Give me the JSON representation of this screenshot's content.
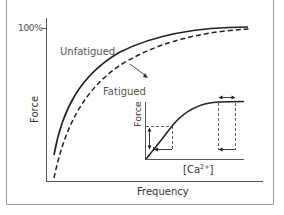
{
  "diagram": {
    "title": "",
    "main_axes": {
      "y_label": "Force",
      "x_label": "Frequency",
      "y_tick": "100%"
    },
    "curves": [
      {
        "name": "Unfatigued",
        "style": "solid"
      },
      {
        "name": "Fatigued",
        "style": "dashed"
      }
    ],
    "annotation": "arrow from Unfatigued toward Fatigued",
    "inset": {
      "y_label": "Force",
      "x_label_base": "[Ca",
      "x_label_sup": "2+",
      "x_label_end": "]"
    },
    "colors": {
      "line": "#222222",
      "frame": "#999999",
      "axis": "#555555"
    }
  }
}
